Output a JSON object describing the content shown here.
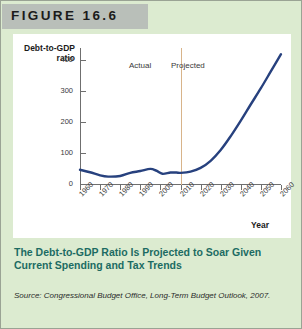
{
  "figure": {
    "number_label": "FIGURE 16.6",
    "caption": "The Debt-to-GDP Ratio Is Projected to Soar Given Current Spending and Tax Trends",
    "source": "Source: Congressional Budget Office, Long-Term Budget Outlook, 2007.",
    "colors": {
      "panel_background": "#dcebd0",
      "header_band": "#b9bfb9",
      "chart_background": "#ffffff",
      "line": "#27417e",
      "divider": "#d8b48a",
      "caption_text": "#1c6b63",
      "axis": "#6f6f6f"
    }
  },
  "chart_data": {
    "type": "line",
    "title": "",
    "xlabel": "Year",
    "ylabel": "Debt-to-GDP ratio",
    "xlim": [
      1960,
      2060
    ],
    "ylim": [
      0,
      440
    ],
    "yticks": [
      0,
      100,
      200,
      300,
      400
    ],
    "ytick_labels": [
      "0",
      "100",
      "200",
      "300",
      "400"
    ],
    "xticks": [
      1960,
      1970,
      1980,
      1990,
      2000,
      2010,
      2020,
      2030,
      2040,
      2050,
      2060
    ],
    "xtick_labels": [
      "1960",
      "1970",
      "1980",
      "1990",
      "2000",
      "2010",
      "2020",
      "2030",
      "2040",
      "2050",
      "2060"
    ],
    "grid": false,
    "legend": "none",
    "annotations": [
      {
        "text": "Actual",
        "x": 1990,
        "note": "left of divider"
      },
      {
        "text": "Projected",
        "x": 2025,
        "note": "right of divider"
      },
      {
        "text": "divider",
        "x": 2010,
        "type": "vertical-line"
      }
    ],
    "series": [
      {
        "name": "Debt-to-GDP ratio",
        "color": "#27417e",
        "x": [
          1960,
          1965,
          1970,
          1974,
          1980,
          1985,
          1990,
          1995,
          1998,
          2001,
          2005,
          2008,
          2010,
          2015,
          2020,
          2025,
          2030,
          2035,
          2040,
          2045,
          2050,
          2055,
          2060
        ],
        "values": [
          46,
          38,
          28,
          24,
          26,
          36,
          42,
          49,
          43,
          33,
          37,
          37,
          36,
          40,
          52,
          75,
          110,
          155,
          205,
          258,
          310,
          365,
          420
        ]
      }
    ]
  }
}
